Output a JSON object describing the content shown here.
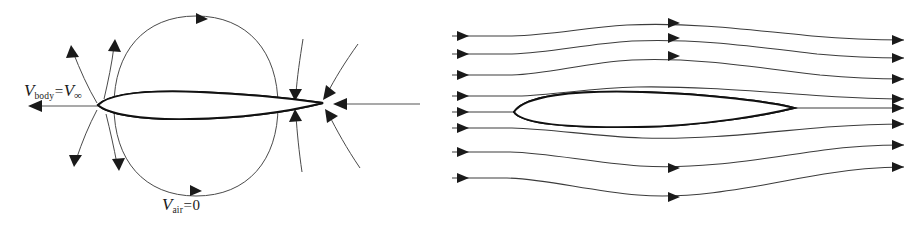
{
  "figure": {
    "type": "diagram",
    "background_color": "#ffffff",
    "line_color": "#3c3c3c",
    "outline_color": "#111111",
    "panel_count": 2
  },
  "panels": [
    {
      "id": "body-moving",
      "name": "body-moving-through-still-air",
      "body": {
        "name": "airfoil-section",
        "hatched": true,
        "chord_px": 225,
        "leading_edge_x": 98,
        "trailing_edge_x": 323
      },
      "labels": {
        "velocity": {
          "symbol": "V",
          "subscript": "body",
          "equals": "=",
          "value_symbol": "V",
          "value_subscript": "∞",
          "text": "V_body = V_∞"
        },
        "rest": {
          "symbol": "V",
          "subscript": "air",
          "equals": "=",
          "value": "0",
          "text": "V_air = 0"
        }
      },
      "flow": {
        "description": "radial arrows emanating from and converging to the body, closed oval streamline around body",
        "oval_streamline": true,
        "radial_arrow_count": 10,
        "horizontal_arrow_left": "leftward",
        "horizontal_arrow_right": "leftward"
      }
    },
    {
      "id": "air-moving",
      "name": "air-moving-past-fixed-body",
      "body": {
        "name": "airfoil-section",
        "hatched": true,
        "chord_px": 280,
        "leading_edge_x": 62,
        "trailing_edge_x": 342
      },
      "labels": {
        "velocity": {
          "symbol": "V",
          "subscript": "air",
          "equals": "=",
          "value_symbol": "V",
          "value_subscript": "∞",
          "text": "V_air = V_∞"
        },
        "rest": {
          "symbol": "V",
          "subscript": "body",
          "equals": "=",
          "value": "0",
          "text": "V_body = 0"
        }
      },
      "flow": {
        "description": "horizontal streamlines flowing left to right, deflected around the body",
        "streamline_count": 8,
        "direction": "left-to-right",
        "arrowheads_per_streamline": 3
      }
    }
  ]
}
